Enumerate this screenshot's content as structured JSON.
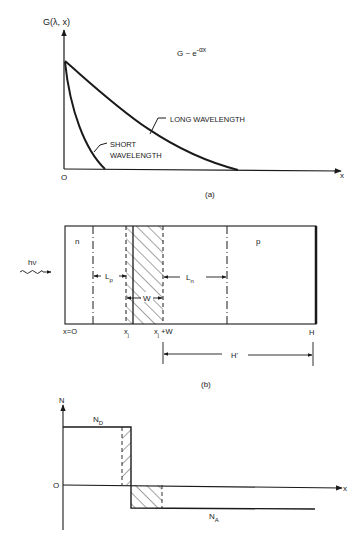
{
  "panel_a": {
    "y_axis_label": "G(λ, x)",
    "x_axis_label": "x",
    "origin_label": "O",
    "formula_base": "G ~ e",
    "formula_exponent": "-αx",
    "long_label": "LONG WAVELENGTH",
    "short_label_line1": "SHORT",
    "short_label_line2": "WAVELENGTH",
    "caption": "(a)"
  },
  "panel_b": {
    "n_region": "n",
    "p_region": "p",
    "light_label": "hν",
    "lp_label": "L",
    "lp_sub": "p",
    "ln_label": "L",
    "ln_sub": "n",
    "w_label": "W",
    "x0_label": "x=O",
    "xj_label": "x",
    "xj_sub": "j",
    "xjw_label": "x",
    "xjw_sub": "j",
    "xjw_suffix": " +W",
    "h_label": "H",
    "hprime_label": "H'",
    "caption": "(b)"
  },
  "panel_c": {
    "y_axis_label": "N",
    "x_axis_label": "x",
    "origin_label": "O",
    "nd_label": "N",
    "nd_sub": "D",
    "na_label": "N",
    "na_sub": "A"
  },
  "colors": {
    "ink": "#1a1a1a",
    "background": "#ffffff"
  }
}
